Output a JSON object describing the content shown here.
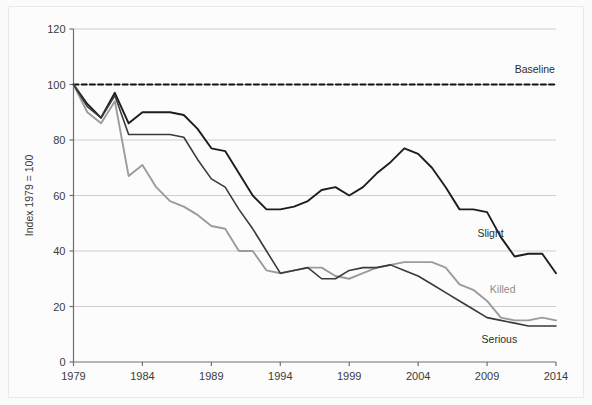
{
  "figure": {
    "background_color": "#fbfbfb",
    "border_color": "#e9e9e9"
  },
  "axis": {
    "ylabel": "Index 1979 = 100",
    "y_ticks": [
      "0",
      "20",
      "40",
      "60",
      "80",
      "100",
      "120"
    ],
    "x_ticks": [
      "1979",
      "1984",
      "1989",
      "1994",
      "1999",
      "2004",
      "2009",
      "2014"
    ],
    "axis_color": "#6e6e6e",
    "grid_color": "#c8c8c8"
  },
  "annotations": {
    "baseline": "Baseline",
    "slight": "Slight",
    "killed": "Killed",
    "serious": "Serious"
  },
  "chart_data": {
    "type": "line",
    "title": "",
    "subtitle": "",
    "xlabel": "",
    "ylabel": "Index 1979 = 100",
    "xlim": [
      1979,
      2014
    ],
    "ylim": [
      0,
      120
    ],
    "ytick_step": 20,
    "xtick_step": 5,
    "grid": "horizontal",
    "legend": "inline-labels",
    "x": [
      1979,
      1980,
      1981,
      1982,
      1983,
      1984,
      1985,
      1986,
      1987,
      1988,
      1989,
      1990,
      1991,
      1992,
      1993,
      1994,
      1995,
      1996,
      1997,
      1998,
      1999,
      2000,
      2001,
      2002,
      2003,
      2004,
      2005,
      2006,
      2007,
      2008,
      2009,
      2010,
      2011,
      2012,
      2013,
      2014
    ],
    "series": [
      {
        "name": "Baseline",
        "color": "#111111",
        "style": "dashed",
        "width": 2,
        "values": [
          100,
          100,
          100,
          100,
          100,
          100,
          100,
          100,
          100,
          100,
          100,
          100,
          100,
          100,
          100,
          100,
          100,
          100,
          100,
          100,
          100,
          100,
          100,
          100,
          100,
          100,
          100,
          100,
          100,
          100,
          100,
          100,
          100,
          100,
          100,
          100
        ],
        "label": "Baseline",
        "label_x": 2011,
        "label_y": 104
      },
      {
        "name": "Slight",
        "color": "#1d1d1d",
        "style": "solid",
        "width": 1.9,
        "values": [
          100,
          93,
          88,
          97,
          86,
          90,
          90,
          90,
          89,
          84,
          77,
          76,
          68,
          60,
          55,
          55,
          56,
          58,
          62,
          63,
          60,
          63,
          68,
          72,
          77,
          75,
          70,
          63,
          55,
          55,
          54,
          45,
          38,
          39,
          39,
          32
        ],
        "label": "Slight",
        "label_x": 2008.3,
        "label_y": 45
      },
      {
        "name": "Killed",
        "color": "#9b9b9b",
        "style": "solid",
        "width": 1.9,
        "values": [
          100,
          90,
          86,
          94,
          67,
          71,
          63,
          58,
          56,
          53,
          49,
          48,
          40,
          40,
          33,
          32,
          33,
          34,
          34,
          31,
          30,
          32,
          34,
          35,
          36,
          36,
          36,
          34,
          28,
          26,
          22,
          16,
          15,
          15,
          16,
          15
        ],
        "label": "Killed",
        "label_x": 2009.2,
        "label_y": 25
      },
      {
        "name": "Serious",
        "color": "#3a3a3a",
        "style": "solid",
        "width": 1.6,
        "values": [
          100,
          92,
          88,
          96,
          82,
          82,
          82,
          82,
          81,
          73,
          66,
          63,
          55,
          48,
          40,
          32,
          33,
          34,
          30,
          30,
          33,
          34,
          34,
          35,
          33,
          31,
          28,
          25,
          22,
          19,
          16,
          15,
          14,
          13,
          13,
          13
        ],
        "label": "Serious",
        "label_x": 2008.6,
        "label_y": 7
      }
    ]
  }
}
